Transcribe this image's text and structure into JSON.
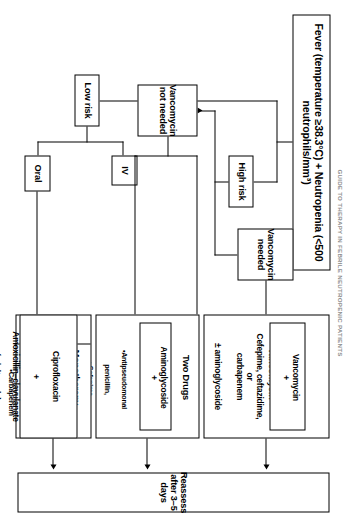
{
  "figure": {
    "header": "GUIDE TO THERAPY IN FEBRILE NEUTROPENIC PATIENTS",
    "title": "Fever (temperature ≥38.3°C) + Neutropenia (<500 neutrophils/mm³)",
    "risk": {
      "high": "High risk",
      "low": "Low risk"
    },
    "route": {
      "iv": "IV",
      "oral": "Oral"
    },
    "vancomycin": {
      "needed": "Vancomycin\nneeded",
      "not_needed": "Vancomycin\nnot needed"
    },
    "regimens": {
      "vanc_plus": {
        "label": "Vancomycin +",
        "inner": "Vancomycin\n+",
        "detail": "Cefepime, ceftazidime,\nor\ncarbapenem",
        "suffix": "± aminoglycoside"
      },
      "two_drugs": {
        "label": "Two Drugs",
        "inner": "Aminoglycoside\n+",
        "bullets": [
          "•Antipseudomonal",
          "penicillin,",
          "• Cefepime,",
          "• Ceftazidime, or",
          "• Carbapenem"
        ]
      },
      "monotherapy": {
        "label": "Monotherapy",
        "bullets": [
          "•Cefepime,",
          "•Ceftazidime,",
          "or",
          "•Carbapenem"
        ]
      },
      "oral_regimen": {
        "line1": "Ciprofloxacin",
        "line2": "+",
        "line3": "Amoxicillin–clavulanate",
        "line4": "(adults only)"
      }
    },
    "outcome": "Reassess after 3–5 days"
  }
}
